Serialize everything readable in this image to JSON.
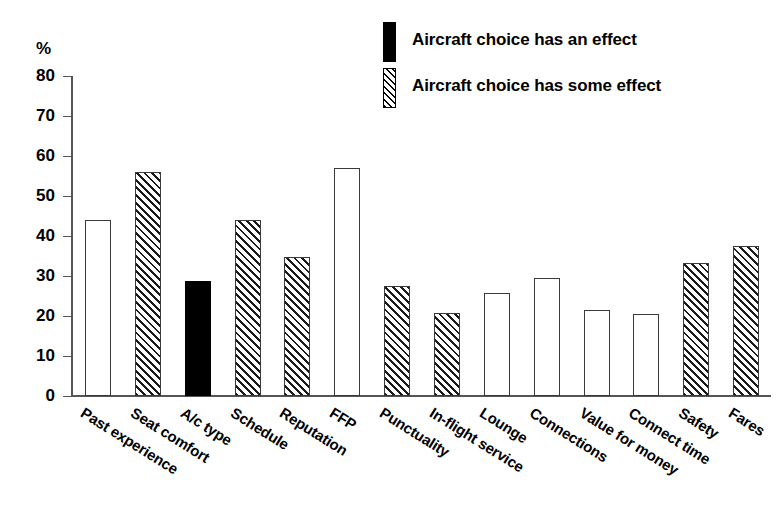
{
  "chart_data": {
    "type": "bar",
    "title": "",
    "subtitle": "",
    "xlabel": "",
    "ylabel": "%",
    "ylim": [
      0,
      80
    ],
    "ytick_values": [
      80,
      70,
      60,
      50,
      40,
      30,
      20,
      10,
      0
    ],
    "ytick_labels": [
      "80",
      "70",
      "60",
      "50",
      "40",
      "30",
      "20",
      "10",
      "0"
    ],
    "grid": false,
    "legend_position": "top-right",
    "categories": [
      "Past experience",
      "Seat comfort",
      "A/c type",
      "Schedule",
      "Reputation",
      "FFP",
      "Punctuality",
      "In-flight service",
      "Lounge",
      "Connections",
      "Value for money",
      "Connect time",
      "Safety",
      "Fares"
    ],
    "values": [
      44.0,
      56.0,
      28.8,
      44.0,
      34.8,
      57.0,
      27.5,
      20.8,
      25.7,
      29.6,
      21.4,
      20.6,
      33.3,
      37.5
    ],
    "fills": [
      "open",
      "hatch",
      "solid",
      "hatch",
      "hatch",
      "open",
      "hatch",
      "hatch",
      "open",
      "open",
      "open",
      "open",
      "hatch",
      "hatch"
    ],
    "legend": [
      {
        "label": "Aircraft choice has an effect",
        "fill": "solid"
      },
      {
        "label": "Aircraft choice has some effect",
        "fill": "hatch"
      }
    ],
    "colors": {
      "solid": "#000000",
      "open": "#ffffff",
      "outline": "#3a3a3a",
      "axis": "#555555",
      "text": "#000000"
    }
  }
}
